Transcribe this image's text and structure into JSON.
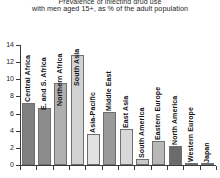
{
  "title": {
    "clipped_line": "Prevalence of injecting drug use",
    "line": "with men aged 15+, as % of the adult population"
  },
  "axis": {
    "y_ticks": [
      "0",
      "2",
      "4",
      "6",
      "8",
      "10",
      "12",
      "14"
    ],
    "y_min": 0,
    "y_max": 14
  },
  "chart_data": {
    "type": "bar",
    "title": "with men aged 15+, as % of the adult population",
    "xlabel": "",
    "ylabel": "",
    "ylim": [
      0,
      14
    ],
    "grid": false,
    "legend": "none",
    "categories": [
      "Central Africa",
      "E. and S. Africa",
      "Northern Africa",
      "South Asia",
      "Asia-Pacific",
      "Middle East",
      "East Asia",
      "South America",
      "Eastern Europe",
      "North America",
      "Western Europe",
      "Japan"
    ],
    "values": [
      7.2,
      6.6,
      9.6,
      12.8,
      3.6,
      6.2,
      4.2,
      0.7,
      2.8,
      2.2,
      0.2,
      0.05
    ],
    "colors": [
      "#808080",
      "#8c8c8c",
      "#b0b0b0",
      "#d2d2d2",
      "#e2e2e2",
      "#9a9a9a",
      "#d8d8d8",
      "#c8c8c8",
      "#b8b8b8",
      "#6b6b6b",
      "#efefef",
      "#f4f4f4"
    ]
  }
}
